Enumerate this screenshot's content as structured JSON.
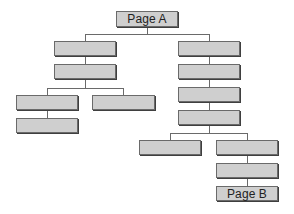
{
  "diagram": {
    "type": "site-hierarchy-tree",
    "colors": {
      "node_fill": "#cfcfcf",
      "node_border": "#6a6a6a",
      "connector": "#6a6a6a",
      "background": "#ffffff"
    },
    "nodes": [
      {
        "id": "page-a",
        "label": "Page A",
        "x": 116,
        "y": 11,
        "w": 62,
        "h": 16
      },
      {
        "id": "l1",
        "label": "",
        "x": 54,
        "y": 41,
        "w": 62,
        "h": 15
      },
      {
        "id": "l2",
        "label": "",
        "x": 54,
        "y": 64,
        "w": 62,
        "h": 15
      },
      {
        "id": "l3a",
        "label": "",
        "x": 16,
        "y": 95,
        "w": 62,
        "h": 15
      },
      {
        "id": "l3b",
        "label": "",
        "x": 92,
        "y": 95,
        "w": 63,
        "h": 15
      },
      {
        "id": "l4a",
        "label": "",
        "x": 16,
        "y": 118,
        "w": 62,
        "h": 15
      },
      {
        "id": "r1",
        "label": "",
        "x": 178,
        "y": 41,
        "w": 62,
        "h": 15
      },
      {
        "id": "r2",
        "label": "",
        "x": 178,
        "y": 64,
        "w": 62,
        "h": 15
      },
      {
        "id": "r3",
        "label": "",
        "x": 178,
        "y": 87,
        "w": 62,
        "h": 15
      },
      {
        "id": "r4",
        "label": "",
        "x": 178,
        "y": 110,
        "w": 62,
        "h": 15
      },
      {
        "id": "r5a",
        "label": "",
        "x": 139,
        "y": 140,
        "w": 62,
        "h": 15
      },
      {
        "id": "r5b",
        "label": "",
        "x": 216,
        "y": 140,
        "w": 62,
        "h": 15
      },
      {
        "id": "r6b",
        "label": "",
        "x": 216,
        "y": 163,
        "w": 62,
        "h": 15
      },
      {
        "id": "page-b",
        "label": "Page B",
        "x": 216,
        "y": 186,
        "w": 62,
        "h": 15
      }
    ],
    "edges": [
      [
        "page-a",
        "l1"
      ],
      [
        "page-a",
        "r1"
      ],
      [
        "l1",
        "l2"
      ],
      [
        "l2",
        "l3a"
      ],
      [
        "l2",
        "l3b"
      ],
      [
        "l3a",
        "l4a"
      ],
      [
        "r1",
        "r2"
      ],
      [
        "r2",
        "r3"
      ],
      [
        "r3",
        "r4"
      ],
      [
        "r4",
        "r5a"
      ],
      [
        "r4",
        "r5b"
      ],
      [
        "r5b",
        "r6b"
      ],
      [
        "r6b",
        "page-b"
      ]
    ]
  }
}
